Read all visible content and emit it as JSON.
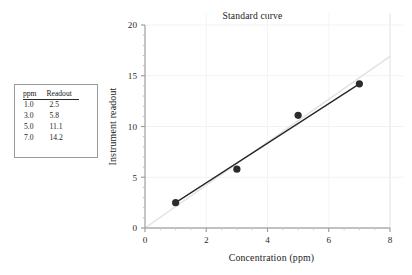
{
  "table": {
    "headers": [
      "ppm",
      "Readout"
    ],
    "rows": [
      [
        "1.0",
        "2.5"
      ],
      [
        "3.0",
        "5.8"
      ],
      [
        "5.0",
        "11.1"
      ],
      [
        "7.0",
        "14.2"
      ]
    ]
  },
  "chart_data": {
    "type": "scatter",
    "title": "Standard curve",
    "xlabel": "Concentration (ppm)",
    "ylabel": "Instrument readout",
    "x": [
      1.0,
      3.0,
      5.0,
      7.0
    ],
    "values": [
      2.5,
      5.8,
      11.1,
      14.2
    ],
    "series": [
      {
        "name": "Standard readings",
        "x": [
          1.0,
          3.0,
          5.0,
          7.0
        ],
        "values": [
          2.5,
          5.8,
          11.1,
          14.2
        ],
        "marker": "filled-circle",
        "color": "#2b2b2b"
      },
      {
        "name": "Fit line through points",
        "x": [
          1.0,
          7.0
        ],
        "values": [
          2.5,
          14.2
        ],
        "marker": "none",
        "color": "#262626"
      },
      {
        "name": "Reference line through origin",
        "x": [
          0.0,
          8.0
        ],
        "values": [
          0.0,
          16.9
        ],
        "marker": "none",
        "color": "#e2e2e2"
      }
    ],
    "xlim": [
      0,
      8
    ],
    "ylim": [
      0,
      20
    ],
    "xticks": [
      0,
      2,
      4,
      6,
      8
    ],
    "yticks": [
      0,
      5,
      10,
      15,
      20
    ],
    "xtick_labels": [
      "0",
      "2",
      "4",
      "6",
      "8"
    ],
    "ytick_labels": [
      "0",
      "5",
      "10",
      "15",
      "20"
    ],
    "x_minor_tick_step": 0.5,
    "y_minor_tick_step": 1,
    "grid": "faint-horizontal-and-vertical",
    "legend": "none"
  }
}
